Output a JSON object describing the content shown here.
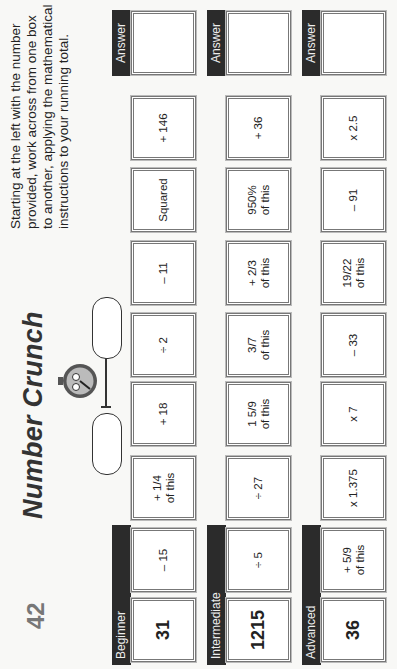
{
  "page": {
    "number": "42",
    "title": "Number Crunch",
    "instructions": "Starting at the left with the number provided, work across from one box to another, applying the mathematical instructions to your running total."
  },
  "stopwatch": {
    "icon": "stopwatch-icon"
  },
  "colors": {
    "label_bar": "#2b2b2b",
    "box_border": "#777777",
    "title": "#333333",
    "page_number": "#777777"
  },
  "rows": [
    {
      "level": "Beginner",
      "start": "31",
      "steps": [
        "– 15",
        "+ 1/4\nof this",
        "+ 18",
        "÷ 2",
        "– 11",
        "Squared",
        "+ 146"
      ],
      "answer_label": "Answer",
      "answer": ""
    },
    {
      "level": "Intermediate",
      "start": "1215",
      "steps": [
        "÷ 5",
        "÷ 27",
        "1 5/9\nof this",
        "3/7\nof this",
        "+ 2/3\nof this",
        "950%\nof this",
        "+ 36"
      ],
      "answer_label": "Answer",
      "answer": ""
    },
    {
      "level": "Advanced",
      "start": "36",
      "steps": [
        "+ 5/9\nof this",
        "x 1.375",
        "x 7",
        "– 33",
        "19/22\nof this",
        "– 91",
        "x 2.5"
      ],
      "answer_label": "Answer",
      "answer": ""
    }
  ]
}
